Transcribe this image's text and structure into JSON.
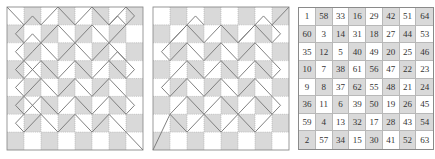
{
  "figure": {
    "grid_size": 8,
    "colors": {
      "shade": "#d9d9d9",
      "light": "#ffffff",
      "grid_line": "#a0a0a0",
      "path_line": "#7a7a7a",
      "border": "#8a8a8a"
    },
    "shading_rule": "cells where (row+col) is odd are shaded",
    "panels": [
      {
        "id": "panel-1",
        "type": "path-diagram",
        "paths": [
          [
            [
              0,
              0
            ],
            [
              1,
              1
            ],
            [
              0.5,
              1.5
            ],
            [
              1,
              2
            ],
            [
              1.5,
              1.5
            ],
            [
              2,
              2
            ],
            [
              1.5,
              2.5
            ],
            [
              1,
              3
            ],
            [
              0.5,
              2.5
            ],
            [
              1,
              2
            ]
          ],
          [
            [
              1,
              1
            ],
            [
              1.5,
              0.5
            ],
            [
              2,
              1
            ],
            [
              3,
              0
            ],
            [
              4,
              1
            ],
            [
              5,
              0
            ],
            [
              6,
              1
            ],
            [
              7,
              0
            ],
            [
              7.5,
              0.5
            ],
            [
              7,
              1
            ],
            [
              6,
              2
            ],
            [
              5,
              1
            ],
            [
              4,
              2
            ],
            [
              3,
              1
            ],
            [
              2,
              2
            ]
          ],
          [
            [
              2,
              2
            ],
            [
              3,
              3
            ],
            [
              4,
              2
            ],
            [
              5,
              3
            ],
            [
              6,
              2
            ],
            [
              7,
              3
            ],
            [
              7.5,
              3.5
            ],
            [
              7,
              4
            ],
            [
              6,
              3
            ],
            [
              5,
              4
            ],
            [
              4,
              3
            ],
            [
              3,
              4
            ],
            [
              2,
              3
            ],
            [
              1,
              4
            ],
            [
              0.5,
              4.5
            ],
            [
              1,
              5
            ],
            [
              2,
              4
            ],
            [
              3,
              5
            ],
            [
              4,
              4
            ],
            [
              5,
              5
            ],
            [
              6,
              4
            ],
            [
              7,
              5
            ],
            [
              7.5,
              5.5
            ],
            [
              7,
              6
            ],
            [
              6,
              5
            ],
            [
              5,
              6
            ],
            [
              4,
              5
            ],
            [
              3,
              6
            ],
            [
              2,
              5
            ],
            [
              1,
              6
            ],
            [
              0.5,
              6.5
            ],
            [
              1,
              7
            ],
            [
              2,
              6
            ],
            [
              3,
              7
            ],
            [
              4,
              6
            ],
            [
              5,
              7
            ],
            [
              6,
              6
            ],
            [
              7,
              7
            ],
            [
              8,
              8
            ]
          ],
          [
            [
              1,
              4
            ],
            [
              0.5,
              3.5
            ],
            [
              1,
              3
            ],
            [
              2,
              4
            ]
          ],
          [
            [
              1,
              6
            ],
            [
              0.5,
              5.5
            ],
            [
              1,
              5
            ],
            [
              2,
              6
            ]
          ],
          [
            [
              6,
              1
            ],
            [
              6.5,
              0.5
            ],
            [
              7,
              1
            ]
          ],
          [
            [
              6,
              3
            ],
            [
              6.5,
              2.5
            ],
            [
              7,
              3
            ]
          ]
        ]
      },
      {
        "id": "panel-2",
        "type": "path-diagram",
        "paths": [
          [
            [
              8,
              0
            ],
            [
              7,
              1
            ],
            [
              7.5,
              1.5
            ],
            [
              7,
              2
            ],
            [
              6,
              1
            ],
            [
              5,
              2
            ],
            [
              4,
              1
            ],
            [
              3,
              2
            ],
            [
              2,
              1
            ],
            [
              1,
              2
            ],
            [
              0.5,
              2.5
            ],
            [
              1,
              3
            ],
            [
              2,
              2
            ],
            [
              3,
              3
            ],
            [
              4,
              2
            ],
            [
              5,
              3
            ],
            [
              6,
              2
            ],
            [
              7,
              3
            ],
            [
              7.5,
              3.5
            ],
            [
              7,
              4
            ],
            [
              6,
              3
            ],
            [
              5,
              4
            ],
            [
              4,
              3
            ],
            [
              3,
              4
            ],
            [
              2,
              3
            ],
            [
              1,
              4
            ],
            [
              0.5,
              4.5
            ],
            [
              1,
              5
            ],
            [
              2,
              4
            ],
            [
              3,
              5
            ],
            [
              4,
              4
            ],
            [
              5,
              5
            ],
            [
              6,
              4
            ],
            [
              7,
              5
            ],
            [
              7.5,
              5.5
            ],
            [
              7,
              6
            ],
            [
              6,
              5
            ],
            [
              5,
              6
            ],
            [
              4,
              5
            ],
            [
              3,
              6
            ],
            [
              2,
              5
            ],
            [
              1,
              6
            ],
            [
              0,
              8
            ]
          ],
          [
            [
              1,
              2
            ],
            [
              1.5,
              1.5
            ],
            [
              2,
              1
            ],
            [
              2.5,
              0.5
            ],
            [
              3,
              1
            ]
          ],
          [
            [
              5,
              2
            ],
            [
              5.5,
              1.5
            ],
            [
              6,
              1
            ],
            [
              6.5,
              0.5
            ],
            [
              7,
              1
            ]
          ],
          [
            [
              3,
              6
            ],
            [
              4,
              7
            ],
            [
              5,
              6
            ],
            [
              6,
              7
            ],
            [
              7,
              6
            ]
          ],
          [
            [
              1,
              6
            ],
            [
              2,
              7
            ],
            [
              3,
              6
            ]
          ]
        ]
      },
      {
        "id": "panel-3",
        "type": "number-grid",
        "rows": [
          [
            "1",
            "58",
            "33",
            "16",
            "29",
            "42",
            "51",
            "64"
          ],
          [
            "60",
            "3",
            "14",
            "31",
            "18",
            "27",
            "44",
            "53"
          ],
          [
            "35",
            "12",
            "5",
            "40",
            "49",
            "20",
            "25",
            "46"
          ],
          [
            "10",
            "7",
            "38",
            "61",
            "56",
            "47",
            "22",
            "23"
          ],
          [
            "9",
            "8",
            "37",
            "62",
            "55",
            "48",
            "21",
            "24"
          ],
          [
            "36",
            "11",
            "6",
            "39",
            "50",
            "19",
            "26",
            "45"
          ],
          [
            "59",
            "4",
            "13",
            "32",
            "17",
            "28",
            "43",
            "54"
          ],
          [
            "2",
            "57",
            "34",
            "15",
            "30",
            "41",
            "52",
            "63"
          ]
        ]
      }
    ]
  }
}
